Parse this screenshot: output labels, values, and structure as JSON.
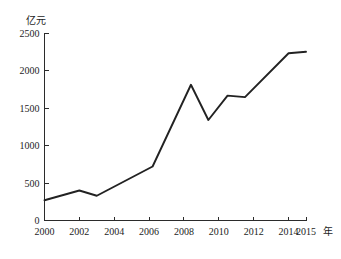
{
  "chart_data": {
    "type": "line",
    "title": "",
    "subtitle": "",
    "xlabel": "年",
    "ylabel": "亿元",
    "xlim": [
      2000,
      2015
    ],
    "ylim": [
      0,
      2500
    ],
    "grid": false,
    "legend": null,
    "x_ticks": [
      "2000",
      "2002",
      "2004",
      "2006",
      "2008",
      "2010",
      "2012",
      "2014",
      "2015"
    ],
    "x_tick_values": [
      2000,
      2002,
      2004,
      2006,
      2008,
      2010,
      2012,
      2014,
      2015
    ],
    "y_ticks": [
      "0",
      "500",
      "1000",
      "1500",
      "2000",
      "2500"
    ],
    "y_tick_values": [
      0,
      500,
      1000,
      1500,
      2000,
      2500
    ],
    "series": [
      {
        "name": "亿元",
        "color": "#222222",
        "x": [
          2000,
          2002,
          2003,
          2006.2,
          2008.4,
          2009.4,
          2010.5,
          2011.5,
          2014,
          2015
        ],
        "values": [
          270,
          400,
          330,
          720,
          1810,
          1340,
          1665,
          1645,
          2230,
          2250
        ]
      }
    ],
    "annotations": []
  },
  "axes": {
    "y_axis_caption": "亿元",
    "x_axis_caption": "年"
  }
}
